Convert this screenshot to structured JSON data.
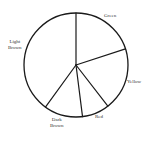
{
  "chart_data": {
    "type": "pie",
    "title": "",
    "start_angle_deg": 0,
    "direction": "clockwise",
    "categories": [
      "Green",
      "Yellow",
      "Red",
      "Dark Brown",
      "Light Brown"
    ],
    "values": [
      20,
      19.5,
      8.5,
      12,
      40
    ],
    "unit": "percent (estimated from slice angles)",
    "legend": "none (labels placed outside slices)",
    "fill": "none (outline only)",
    "stroke_color": "#1a1a1a"
  },
  "labels": {
    "green": "Green",
    "yellow": "Yellow",
    "red": "Red",
    "dark_brown": "Dark\nBrown",
    "light_brown": "Light\nBrown"
  }
}
